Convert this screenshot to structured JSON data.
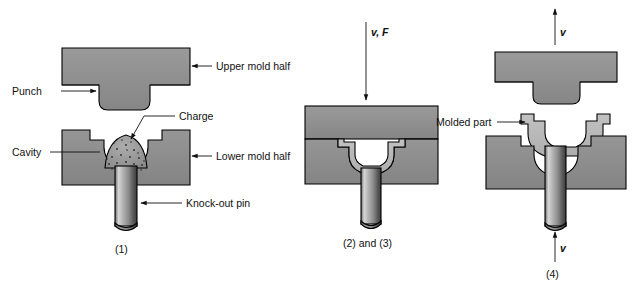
{
  "figure": {
    "colors": {
      "mold_fill": "#8d8d8d",
      "mold_fill_light": "#a0a0a0",
      "part_fill": "#b8b8b8",
      "charge_fill": "#9a9a9a",
      "pin_light": "#d8d8d8",
      "pin_dark": "#4a4a4a",
      "outline": "#000000",
      "text": "#111111",
      "background": "#ffffff"
    }
  },
  "panels": [
    {
      "id": "panel-1",
      "caption": "(1)",
      "labels": [
        {
          "key": "upper_mold_half",
          "text": "Upper mold half"
        },
        {
          "key": "punch",
          "text": "Punch"
        },
        {
          "key": "charge",
          "text": "Charge"
        },
        {
          "key": "cavity",
          "text": "Cavity"
        },
        {
          "key": "lower_mold_half",
          "text": "Lower mold half"
        },
        {
          "key": "knock_out_pin",
          "text": "Knock-out pin"
        }
      ]
    },
    {
      "id": "panel-2",
      "caption": "(2) and (3)",
      "labels": [
        {
          "key": "velocity_force",
          "text": "v, F"
        }
      ]
    },
    {
      "id": "panel-3",
      "caption": "(4)",
      "labels": [
        {
          "key": "velocity_top",
          "text": "v"
        },
        {
          "key": "molded_part",
          "text": "Molded part"
        },
        {
          "key": "velocity_bottom",
          "text": "v"
        }
      ]
    }
  ]
}
